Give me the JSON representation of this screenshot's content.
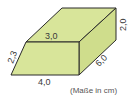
{
  "diagram": {
    "type": "prism-with-trapezoid-cross-section",
    "fill_color": "#d8e59a",
    "edge_color": "#2a2a2a",
    "labels": {
      "top_front_edge": "3,0",
      "slanted_side": "2,3",
      "bottom_front_edge": "4,0",
      "depth_edge": "6,0",
      "back_height": "2,0",
      "units_note": "(Maße in cm)"
    }
  }
}
